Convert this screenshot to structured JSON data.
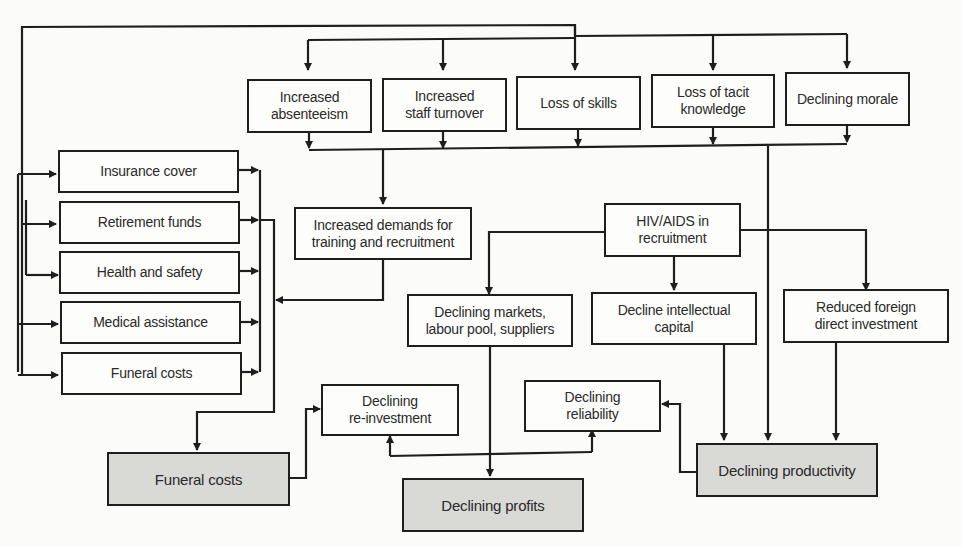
{
  "diagram": {
    "colors": {
      "line": "#1e1e1e",
      "box_fill": "#fdfdfb",
      "shaded_fill": "#d9d9d6",
      "background": "#fbfbf9"
    },
    "top_row": [
      {
        "id": "absenteeism",
        "label": "Increased\nabsenteeism"
      },
      {
        "id": "turnover",
        "label": "Increased\nstaff turnover"
      },
      {
        "id": "skills",
        "label": "Loss of skills"
      },
      {
        "id": "tacit",
        "label": "Loss of tacit\nknowledge"
      },
      {
        "id": "morale",
        "label": "Declining morale"
      }
    ],
    "cost_column": [
      {
        "id": "insurance",
        "label": "Insurance cover"
      },
      {
        "id": "retirement",
        "label": "Retirement funds"
      },
      {
        "id": "health",
        "label": "Health and safety"
      },
      {
        "id": "medical",
        "label": "Medical assistance"
      },
      {
        "id": "funeral_small",
        "label": "Funeral costs"
      }
    ],
    "middle": {
      "training": "Increased demands for\ntraining and recruitment",
      "hiv": "HIV/AIDS in\nrecruitment",
      "markets": "Declining markets,\nlabour pool, suppliers",
      "intellectual": "Decline intellectual\ncapital",
      "fdi": "Reduced foreign\ndirect investment",
      "reinvestment": "Declining\nre-investment",
      "reliability": "Declining\nreliability"
    },
    "outcomes": {
      "funeral_costs": "Funeral costs",
      "profits": "Declining profits",
      "productivity": "Declining productivity"
    }
  }
}
